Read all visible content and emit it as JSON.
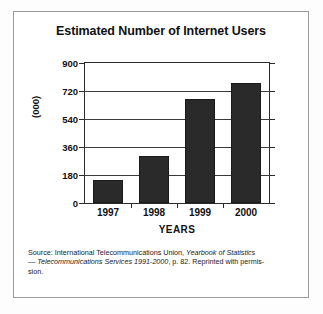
{
  "chart_data": {
    "type": "bar",
    "title": "Estimated Number of Internet Users",
    "categories": [
      "1997",
      "1998",
      "1999",
      "2000"
    ],
    "values": [
      150,
      300,
      670,
      770
    ],
    "xlabel": "YEARS",
    "ylabel": "(000)",
    "ylim": [
      0,
      900
    ],
    "yticks": [
      "0",
      "180",
      "360",
      "540",
      "720",
      "900"
    ],
    "ytick_values": [
      0,
      180,
      360,
      540,
      720,
      900
    ],
    "grid": true,
    "legend": "none",
    "bar_color": "#2a2a2a",
    "axis_color": "#2b2b2b"
  },
  "source": {
    "line1_prefix": "Source: International Telecommunications Union, ",
    "line1_italic": "Yearbook of Statistics",
    "line2_dash": "— ",
    "line2_italic": "Telecommunications Services 1991-2000",
    "line2_suffix": ", p. 82. Reprinted with permis-",
    "line3": "sion."
  }
}
